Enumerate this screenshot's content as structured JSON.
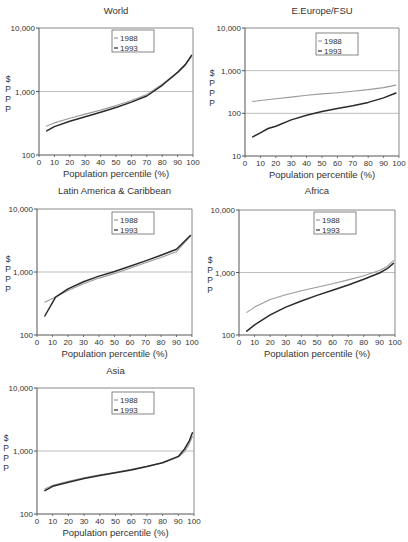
{
  "figure": {
    "x_axis_label": "Population percentile (%)",
    "y_axis_label_chars": [
      "$",
      "P",
      "P",
      "P"
    ],
    "legend": [
      "1988",
      "1993"
    ]
  },
  "colors": {
    "series_1988": "#9a9a9a",
    "series_1993": "#2a2a2a",
    "gridline": "#bdbdbd",
    "frame": "#555555"
  },
  "chart_data": [
    {
      "type": "line",
      "title": "World",
      "xlabel": "Population percentile (%)",
      "ylabel": "$ PPP",
      "yscale": "log",
      "ylim": [
        100,
        10000
      ],
      "yticks": [
        "100",
        "1,000",
        "10,000"
      ],
      "xlim": [
        0,
        100
      ],
      "xticks": [
        "0",
        "10",
        "20",
        "30",
        "40",
        "50",
        "60",
        "70",
        "80",
        "90",
        "100"
      ],
      "grid": "horizontal at 1,000",
      "legend_position": "top-center",
      "series": [
        {
          "name": "1988",
          "x": [
            5,
            10,
            20,
            30,
            40,
            50,
            60,
            70,
            80,
            90,
            95,
            99
          ],
          "values": [
            285,
            320,
            380,
            440,
            510,
            600,
            720,
            900,
            1300,
            2000,
            2600,
            3500
          ]
        },
        {
          "name": "1993",
          "x": [
            5,
            10,
            20,
            30,
            40,
            50,
            60,
            70,
            80,
            90,
            95,
            99
          ],
          "values": [
            240,
            280,
            340,
            400,
            470,
            560,
            680,
            850,
            1250,
            2000,
            2650,
            3700
          ]
        }
      ]
    },
    {
      "type": "line",
      "title": "E.Europe/FSU",
      "xlabel": "Population percentile (%)",
      "ylabel": "$ PPP",
      "yscale": "log",
      "ylim": [
        10,
        10000
      ],
      "yticks": [
        "10",
        "100",
        "1,000",
        "10,000"
      ],
      "xlim": [
        0,
        100
      ],
      "xticks": [
        "0",
        "10",
        "20",
        "30",
        "40",
        "50",
        "60",
        "70",
        "80",
        "90",
        "100"
      ],
      "grid": "horizontal at 100 and 1,000",
      "legend_position": "top-right",
      "series": [
        {
          "name": "1988",
          "x": [
            5,
            20,
            30,
            40,
            50,
            60,
            70,
            80,
            90,
            98
          ],
          "values": [
            190,
            220,
            240,
            265,
            285,
            305,
            330,
            360,
            400,
            460
          ]
        },
        {
          "name": "1993",
          "x": [
            5,
            10,
            15,
            20,
            30,
            40,
            50,
            60,
            70,
            80,
            90,
            98
          ],
          "values": [
            28,
            35,
            44,
            50,
            70,
            90,
            110,
            130,
            150,
            180,
            230,
            300
          ]
        }
      ]
    },
    {
      "type": "line",
      "title": "Latin America & Caribbean",
      "xlabel": "Population percentile (%)",
      "ylabel": "$ PPP",
      "yscale": "log",
      "ylim": [
        100,
        10000
      ],
      "yticks": [
        "100",
        "1,000",
        "10,000"
      ],
      "xlim": [
        0,
        100
      ],
      "xticks": [
        "0",
        "10",
        "20",
        "30",
        "40",
        "50",
        "60",
        "70",
        "80",
        "90",
        "100"
      ],
      "grid": "horizontal at 1,000",
      "legend_position": "top-center",
      "series": [
        {
          "name": "1988",
          "x": [
            5,
            12,
            20,
            30,
            40,
            50,
            60,
            70,
            80,
            90,
            99
          ],
          "values": [
            330,
            400,
            510,
            650,
            800,
            950,
            1150,
            1400,
            1700,
            2100,
            3700
          ]
        },
        {
          "name": "1993",
          "x": [
            5,
            12,
            20,
            30,
            40,
            50,
            60,
            70,
            80,
            90,
            99
          ],
          "values": [
            200,
            400,
            540,
            700,
            860,
            1020,
            1230,
            1500,
            1850,
            2300,
            3800
          ]
        }
      ]
    },
    {
      "type": "line",
      "title": "Africa",
      "xlabel": "Population percentile (%)",
      "ylabel": "$ PPP",
      "yscale": "log",
      "ylim": [
        100,
        10000
      ],
      "yticks": [
        "100",
        "1,000",
        "10,000"
      ],
      "xlim": [
        0,
        100
      ],
      "xticks": [
        "0",
        "10",
        "20",
        "30",
        "40",
        "50",
        "60",
        "70",
        "80",
        "90",
        "100"
      ],
      "grid": "horizontal at 1,000",
      "legend_position": "top-center",
      "series": [
        {
          "name": "1988",
          "x": [
            5,
            10,
            20,
            30,
            40,
            50,
            60,
            70,
            80,
            90,
            95,
            99
          ],
          "values": [
            230,
            280,
            370,
            440,
            510,
            580,
            660,
            760,
            890,
            1080,
            1250,
            1550
          ]
        },
        {
          "name": "1993",
          "x": [
            5,
            10,
            20,
            30,
            40,
            50,
            60,
            70,
            80,
            90,
            95,
            99
          ],
          "values": [
            115,
            145,
            210,
            280,
            350,
            430,
            520,
            630,
            780,
            980,
            1150,
            1400
          ]
        }
      ]
    },
    {
      "type": "line",
      "title": "Asia",
      "xlabel": "Population percentile (%)",
      "ylabel": "$ PPP",
      "yscale": "log",
      "ylim": [
        100,
        10000
      ],
      "yticks": [
        "100",
        "1,000",
        "10,000"
      ],
      "xlim": [
        0,
        100
      ],
      "xticks": [
        "0",
        "10",
        "20",
        "30",
        "40",
        "50",
        "60",
        "70",
        "80",
        "90",
        "100"
      ],
      "grid": "horizontal at 1,000",
      "legend_position": "top-center",
      "series": [
        {
          "name": "1988",
          "x": [
            5,
            10,
            20,
            30,
            40,
            50,
            60,
            70,
            80,
            90,
            94,
            97,
            99
          ],
          "values": [
            250,
            285,
            330,
            375,
            420,
            460,
            510,
            570,
            650,
            800,
            980,
            1300,
            1700
          ]
        },
        {
          "name": "1993",
          "x": [
            5,
            10,
            20,
            30,
            40,
            50,
            60,
            70,
            80,
            90,
            94,
            97,
            99
          ],
          "values": [
            235,
            275,
            320,
            365,
            410,
            450,
            500,
            565,
            650,
            820,
            1080,
            1450,
            1950
          ]
        }
      ]
    }
  ]
}
